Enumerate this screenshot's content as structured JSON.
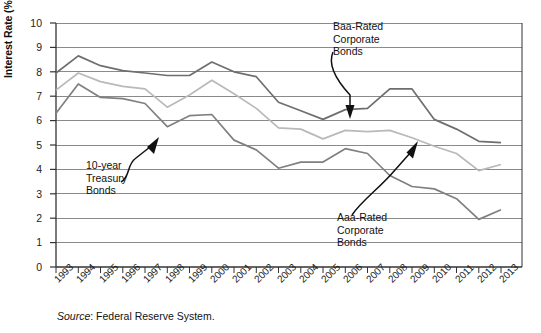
{
  "chart_data": {
    "type": "line",
    "title": "",
    "xlabel": "",
    "ylabel": "Interest Rate (%)",
    "ylim": [
      0,
      10
    ],
    "ytick_labels": [
      "0",
      "1",
      "2",
      "3",
      "4",
      "5",
      "6",
      "7",
      "8",
      "9",
      "10"
    ],
    "grid": true,
    "grid_axis": "y",
    "legend_position": "none",
    "categories": [
      "1993",
      "1994",
      "1995",
      "1996",
      "1997",
      "1998",
      "1999",
      "2000",
      "2001",
      "2002",
      "2003",
      "2004",
      "2005",
      "2006",
      "2007",
      "2008",
      "2009",
      "2010",
      "2011",
      "2012",
      "2013"
    ],
    "series": [
      {
        "name": "Baa-Rated Corporate Bonds",
        "color": "#6e6e6e",
        "values": [
          7.95,
          8.65,
          8.25,
          8.05,
          7.95,
          7.85,
          7.85,
          8.4,
          8.0,
          7.8,
          6.75,
          6.4,
          6.05,
          6.45,
          6.5,
          7.3,
          7.3,
          6.05,
          5.65,
          5.15,
          5.1
        ]
      },
      {
        "name": "Aaa-Rated Corporate Bonds",
        "color": "#b9b9b9",
        "values": [
          7.25,
          7.95,
          7.6,
          7.4,
          7.3,
          6.55,
          7.05,
          7.65,
          7.1,
          6.5,
          5.7,
          5.65,
          5.25,
          5.6,
          5.55,
          5.6,
          5.3,
          4.95,
          4.65,
          3.95,
          4.2
        ]
      },
      {
        "name": "10-year Treasury Bonds",
        "color": "#808080",
        "values": [
          6.3,
          7.5,
          6.95,
          6.9,
          6.7,
          5.75,
          6.2,
          6.25,
          5.2,
          4.8,
          4.05,
          4.3,
          4.3,
          4.85,
          4.65,
          3.75,
          3.3,
          3.2,
          2.8,
          1.95,
          2.35
        ]
      }
    ],
    "annotations": [
      {
        "name": "baa-rated-annotation",
        "lines": [
          "Baa-Rated",
          "Corporate",
          "Bonds"
        ],
        "target_year": "2007"
      },
      {
        "name": "aaa-rated-annotation",
        "lines": [
          "Aaa-Rated",
          "Corporate",
          "Bonds"
        ],
        "target_year": "2009"
      },
      {
        "name": "ten-year-treasury-annotation",
        "lines": [
          "10-year",
          "Treasury",
          "Bonds"
        ],
        "target_year": "1997"
      }
    ]
  },
  "annotation_text": {
    "baa_line1": "Baa-Rated",
    "baa_line2": "Corporate",
    "baa_line3": "Bonds",
    "aaa_line1": "Aaa-Rated",
    "aaa_line2": "Corporate",
    "aaa_line3": "Bonds",
    "treasury_line1": "10-year",
    "treasury_line2": "Treasury",
    "treasury_line3": "Bonds"
  },
  "source": {
    "label": "Source",
    "separator": ":",
    "text": " Federal Reserve System."
  },
  "axes": {
    "ylabel": "Interest Rate (%)",
    "yticks": [
      "10",
      "9",
      "8",
      "7",
      "6",
      "5",
      "4",
      "3",
      "2",
      "1",
      "0"
    ],
    "xticks": [
      "1993",
      "1994",
      "1995",
      "1996",
      "1997",
      "1998",
      "1999",
      "2000",
      "2001",
      "2002",
      "2003",
      "2004",
      "2005",
      "2006",
      "2007",
      "2008",
      "2009",
      "2010",
      "2011",
      "2012",
      "2013"
    ]
  },
  "colors": {
    "baa": "#6e6e6e",
    "aaa": "#b9b9b9",
    "treasury": "#808080",
    "grid": "#8a8a8a",
    "axis": "#333333"
  }
}
